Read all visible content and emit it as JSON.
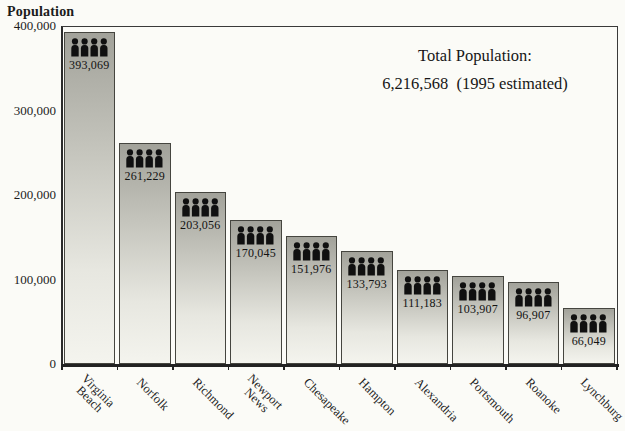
{
  "chart_data": {
    "type": "bar",
    "title": "",
    "ylabel": "Population",
    "xlabel": "",
    "categories": [
      "Virginia Beach",
      "Norfolk",
      "Richmond",
      "Newport News",
      "Chesapeake",
      "Hampton",
      "Alexandria",
      "Portsmouth",
      "Roanoke",
      "Lynchburg"
    ],
    "category_lines": [
      [
        "Virginia",
        "Beach"
      ],
      [
        "Norfolk"
      ],
      [
        "Richmond"
      ],
      [
        "Newport",
        "News"
      ],
      [
        "Chesapeake"
      ],
      [
        "Hampton"
      ],
      [
        "Alexandria"
      ],
      [
        "Portsmouth"
      ],
      [
        "Roanoke"
      ],
      [
        "Lynchburg"
      ]
    ],
    "values": [
      393069,
      261229,
      203056,
      170045,
      151976,
      133793,
      111183,
      103907,
      96907,
      66049
    ],
    "value_labels": [
      "393,069",
      "261,229",
      "203,056",
      "170,045",
      "151,976",
      "133,793",
      "111,183",
      "103,907",
      "96,907",
      "66,049"
    ],
    "ylim": [
      0,
      400000
    ],
    "yticks": [
      {
        "value": 400000,
        "label": "400,000"
      },
      {
        "value": 300000,
        "label": "300,000"
      },
      {
        "value": 200000,
        "label": "200,000"
      },
      {
        "value": 100000,
        "label": "100,000"
      },
      {
        "value": 0,
        "label": "0"
      }
    ],
    "grid": false,
    "legend": false,
    "annotation": {
      "line1": "Total Population:",
      "line2": "6,216,568  (1995 estimated)"
    },
    "bar_icon": "people-icon",
    "style": {
      "bar_gradient_top": "#a2a29a",
      "bar_gradient_bottom": "#f4f4ee",
      "bar_border": "#45453f",
      "icon_color": "#101010",
      "axis_color": "#2b2b2b",
      "background": "#fbfbf7"
    }
  }
}
